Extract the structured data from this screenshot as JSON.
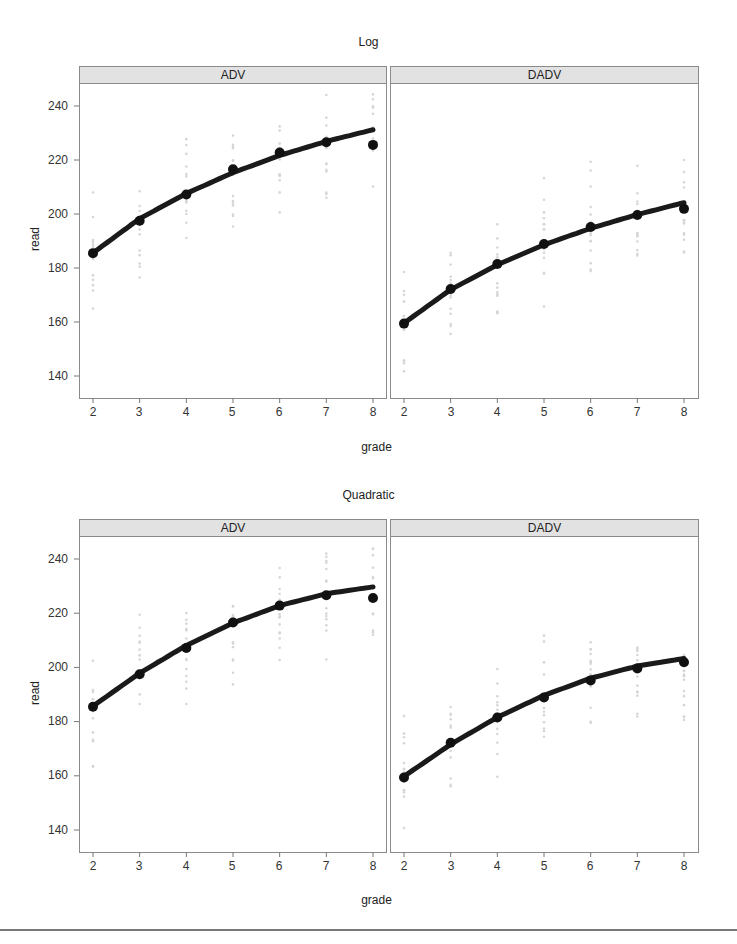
{
  "figures": [
    {
      "title": "Log",
      "xlabel": "grade",
      "ylabel": "read",
      "panels": [
        {
          "label": "ADV"
        },
        {
          "label": "DADV"
        }
      ]
    },
    {
      "title": "Quadratic",
      "xlabel": "grade",
      "ylabel": "read",
      "panels": [
        {
          "label": "ADV"
        },
        {
          "label": "DADV"
        }
      ]
    }
  ],
  "axis": {
    "x_ticks": [
      "2",
      "3",
      "4",
      "5",
      "6",
      "7",
      "8"
    ],
    "y_ticks": [
      "140",
      "160",
      "180",
      "200",
      "220",
      "240"
    ]
  },
  "caption": "",
  "chart_data": [
    {
      "type": "line",
      "title": "Log",
      "xlabel": "grade",
      "ylabel": "read",
      "x": [
        2,
        3,
        4,
        5,
        6,
        7,
        8
      ],
      "xlim": [
        1.7,
        8.3
      ],
      "ylim": [
        132,
        248
      ],
      "grid": false,
      "panels": [
        {
          "label": "ADV",
          "observed_means": [
            185.5,
            197.5,
            207.2,
            216.6,
            222.8,
            226.6,
            225.6
          ],
          "fitted": [
            185.6,
            198.3,
            207.6,
            215.3,
            221.7,
            226.9,
            231.2
          ]
        },
        {
          "label": "DADV",
          "observed_means": [
            159.4,
            172.2,
            181.5,
            188.9,
            195.2,
            199.6,
            201.9
          ],
          "fitted": [
            159.6,
            172.0,
            181.2,
            188.6,
            194.7,
            199.8,
            204.2
          ]
        }
      ],
      "series_style": {
        "fitted": "thick black line",
        "observed_means": "black filled circles",
        "raw_points": "faint gray dots"
      }
    },
    {
      "type": "line",
      "title": "Quadratic",
      "xlabel": "grade",
      "ylabel": "read",
      "x": [
        2,
        3,
        4,
        5,
        6,
        7,
        8
      ],
      "xlim": [
        1.7,
        8.3
      ],
      "ylim": [
        132,
        248
      ],
      "grid": false,
      "panels": [
        {
          "label": "ADV",
          "observed_means": [
            185.5,
            197.5,
            207.2,
            216.6,
            222.8,
            226.6,
            225.6
          ],
          "fitted": [
            185.7,
            197.9,
            208.1,
            216.4,
            222.8,
            227.2,
            229.7
          ]
        },
        {
          "label": "DADV",
          "observed_means": [
            159.4,
            172.2,
            181.5,
            188.9,
            195.2,
            199.6,
            201.9
          ],
          "fitted": [
            159.8,
            171.6,
            181.6,
            189.7,
            196.0,
            200.5,
            203.3
          ]
        }
      ],
      "series_style": {
        "fitted": "thick black line",
        "observed_means": "black filled circles",
        "raw_points": "faint gray dots"
      }
    }
  ]
}
